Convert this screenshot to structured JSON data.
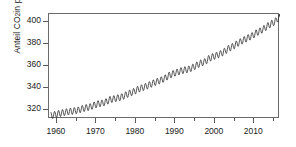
{
  "chart_data": {
    "type": "line",
    "title": "",
    "subtitle": "",
    "xlabel": "",
    "ylabel": "Anteil CO₂ in ppm",
    "ylabel_text": "Anteil CO",
    "ylabel_sub": "2",
    "ylabel_tail": " in ppm",
    "xlim": [
      1958,
      2016.5
    ],
    "ylim": [
      312,
      407
    ],
    "grid": false,
    "legend": null,
    "legend_position": "none",
    "x_ticks_major": [
      1960,
      1970,
      1980,
      1990,
      2000,
      2010
    ],
    "x_ticks_major_labels": [
      "1960",
      "1970",
      "1980",
      "1990",
      "2000",
      "2010"
    ],
    "x_ticks_minor": [
      1965,
      1975,
      1985,
      1995,
      2005,
      2015
    ],
    "y_ticks": [
      320,
      340,
      360,
      380,
      400
    ],
    "y_tick_labels": [
      "320",
      "340",
      "360",
      "380",
      "400"
    ],
    "line_color": "#2b2b2b",
    "line_width": 0.8,
    "frame_color": "#6b6b6b",
    "background": "#ffffff",
    "series": [
      {
        "name": "Monatlicher CO2-Mittelwert (Mauna Loa)",
        "description": "Keeling-Kurve: monatliche CO2-Konzentration mit Jahresgang",
        "x": [
          1958.5,
          1959.5,
          1960.5,
          1961.5,
          1962.5,
          1963.5,
          1964.5,
          1965.5,
          1966.5,
          1967.5,
          1968.5,
          1969.5,
          1970.5,
          1971.5,
          1972.5,
          1973.5,
          1974.5,
          1975.5,
          1976.5,
          1977.5,
          1978.5,
          1979.5,
          1980.5,
          1981.5,
          1982.5,
          1983.5,
          1984.5,
          1985.5,
          1986.5,
          1987.5,
          1988.5,
          1989.5,
          1990.5,
          1991.5,
          1992.5,
          1993.5,
          1994.5,
          1995.5,
          1996.5,
          1997.5,
          1998.5,
          1999.5,
          2000.5,
          2001.5,
          2002.5,
          2003.5,
          2004.5,
          2005.5,
          2006.5,
          2007.5,
          2008.5,
          2009.5,
          2010.5,
          2011.5,
          2012.5,
          2013.5,
          2014.5,
          2015.5,
          2016.4
        ],
        "values": [
          315.3,
          315.9,
          316.9,
          317.6,
          318.4,
          318.9,
          319.4,
          320.0,
          321.4,
          322.2,
          323.0,
          324.6,
          325.7,
          326.3,
          327.5,
          329.7,
          330.2,
          331.1,
          332.0,
          333.8,
          335.4,
          336.8,
          338.8,
          340.1,
          341.4,
          343.0,
          344.6,
          346.0,
          347.4,
          349.2,
          351.6,
          353.1,
          354.4,
          355.6,
          356.4,
          357.1,
          358.8,
          360.8,
          362.6,
          363.7,
          366.7,
          368.4,
          369.6,
          371.1,
          373.2,
          375.8,
          377.5,
          379.8,
          381.9,
          383.8,
          385.6,
          387.4,
          389.9,
          391.6,
          393.9,
          396.5,
          398.6,
          400.8,
          405.0
        ],
        "seasonal_amplitude_ppm": 6.0,
        "seasonal_peak_month": 5,
        "sampling": "monthly"
      }
    ]
  }
}
